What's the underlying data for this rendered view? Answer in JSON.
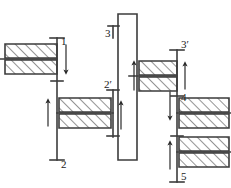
{
  "diagram": {
    "type": "mechanical-kinematic-skeleton",
    "stroke_color": "#3c3c3c",
    "hatch_color": "#3c3c3c",
    "background_color": "#ffffff",
    "labels": {
      "gear1": "1",
      "gear2": "2",
      "gear2p": "2′",
      "gear3": "3",
      "gear3p": "3′",
      "gear4": "4",
      "gear5": "5"
    },
    "shafts": [
      {
        "name": "left-shaft",
        "x": 57,
        "y_top": 38,
        "y_bottom": 160,
        "labels": [
          "1",
          "2"
        ]
      },
      {
        "name": "middle-shaft",
        "x": 113,
        "y_top": 90,
        "y_bottom": 137,
        "labels": [
          "2′"
        ]
      },
      {
        "name": "carrier-frame",
        "x_left": 118,
        "x_right": 137,
        "y_top": 12,
        "y_bottom": 160,
        "labels": [
          "3"
        ]
      },
      {
        "name": "right-shaft",
        "x": 177,
        "y_top": 50,
        "y_bottom": 182,
        "labels": [
          "3′",
          "4",
          "5"
        ]
      }
    ],
    "gears": [
      {
        "name": "gear-1",
        "cx": 31,
        "cy": 59,
        "half_w": 26,
        "half_h": 16,
        "side": "left"
      },
      {
        "name": "gear-2",
        "cx": 85,
        "cy": 113,
        "half_w": 26,
        "half_h": 16,
        "side": "right"
      },
      {
        "name": "gear-3p",
        "cx": 155,
        "cy": 76,
        "half_w": 26,
        "half_h": 16,
        "side": "left"
      },
      {
        "name": "gear-4",
        "cx": 203,
        "cy": 113,
        "half_w": 26,
        "half_h": 16,
        "side": "right"
      },
      {
        "name": "gear-5",
        "cx": 203,
        "cy": 152,
        "half_w": 26,
        "half_h": 16,
        "side": "right"
      }
    ],
    "arrows": [
      {
        "name": "arrow-gear1-down",
        "x": 66,
        "y1": 45,
        "y2": 72,
        "dir": "down"
      },
      {
        "name": "arrow-gear2-up",
        "x": 48,
        "y1": 125,
        "y2": 100,
        "dir": "up"
      },
      {
        "name": "arrow-gear2p-up",
        "x": 121,
        "y1": 128,
        "y2": 102,
        "dir": "up"
      },
      {
        "name": "arrow-gear3p-up",
        "x": 134,
        "y1": 90,
        "y2": 63,
        "dir": "up"
      },
      {
        "name": "arrow-shaft3p-up",
        "x": 185,
        "y1": 88,
        "y2": 64,
        "dir": "up"
      },
      {
        "name": "arrow-gear4-down",
        "x": 170,
        "y1": 92,
        "y2": 118,
        "dir": "down"
      },
      {
        "name": "arrow-gear5-up",
        "x": 170,
        "y1": 168,
        "y2": 142,
        "dir": "up"
      }
    ]
  }
}
